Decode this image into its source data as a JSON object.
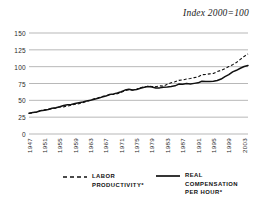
{
  "chart_data": {
    "type": "line",
    "title": "Index 2000=100",
    "xlabel": "",
    "ylabel": "",
    "ylim": [
      0,
      150
    ],
    "xlim": [
      1947,
      2004
    ],
    "grid": true,
    "legend_position": "bottom",
    "yticks": [
      150,
      125,
      100,
      75,
      50,
      25,
      0
    ],
    "xticks": [
      1947,
      1951,
      1955,
      1959,
      1963,
      1967,
      1971,
      1975,
      1979,
      1983,
      1987,
      1991,
      1995,
      1999,
      2003
    ],
    "x": [
      1947,
      1948,
      1949,
      1950,
      1951,
      1952,
      1953,
      1954,
      1955,
      1956,
      1957,
      1958,
      1959,
      1960,
      1961,
      1962,
      1963,
      1964,
      1965,
      1966,
      1967,
      1968,
      1969,
      1970,
      1971,
      1972,
      1973,
      1974,
      1975,
      1976,
      1977,
      1978,
      1979,
      1980,
      1981,
      1982,
      1983,
      1984,
      1985,
      1986,
      1987,
      1988,
      1989,
      1990,
      1991,
      1992,
      1993,
      1994,
      1995,
      1996,
      1997,
      1998,
      1999,
      2000,
      2001,
      2002,
      2003,
      2004
    ],
    "series": [
      {
        "name": "LABOR PRODUCTIVITY*",
        "style": "dashed",
        "color": "#111111",
        "values": [
          30.5,
          31.6,
          32.5,
          35.0,
          35.8,
          36.5,
          37.8,
          38.5,
          40.2,
          40.3,
          41.5,
          42.7,
          44.3,
          44.9,
          46.4,
          48.4,
          50.3,
          52.2,
          53.8,
          55.8,
          56.6,
          58.4,
          58.8,
          59.7,
          62.1,
          64.1,
          66.0,
          64.9,
          66.6,
          68.7,
          70.1,
          70.9,
          70.6,
          70.2,
          71.5,
          71.0,
          73.8,
          76.1,
          77.5,
          79.7,
          80.3,
          81.7,
          82.5,
          83.7,
          84.8,
          88.1,
          88.4,
          89.3,
          90.0,
          92.7,
          94.6,
          97.2,
          100.1,
          103.0,
          106.2,
          110.8,
          115.2,
          119.0
        ]
      },
      {
        "name": "REAL COMPENSATION PER HOUR*",
        "style": "solid",
        "color": "#111111",
        "values": [
          30.8,
          31.8,
          32.6,
          34.6,
          35.2,
          36.3,
          38.3,
          39.1,
          40.5,
          42.3,
          43.3,
          43.8,
          45.3,
          46.3,
          47.4,
          49.0,
          50.1,
          51.7,
          53.0,
          54.8,
          56.3,
          58.6,
          59.6,
          61.0,
          62.7,
          65.2,
          66.5,
          65.5,
          66.0,
          68.0,
          69.3,
          70.4,
          69.8,
          68.3,
          68.5,
          69.3,
          69.7,
          70.4,
          71.5,
          74.1,
          74.0,
          74.9,
          74.4,
          75.2,
          76.0,
          78.3,
          78.0,
          77.9,
          78.2,
          79.4,
          81.6,
          85.2,
          88.1,
          92.3,
          94.6,
          97.6,
          100.2,
          101.8
        ]
      }
    ]
  },
  "legend": [
    {
      "label": "LABOR\nPRODUCTIVITY*",
      "style": "dashed"
    },
    {
      "label": "REAL\nCOMPENSATION\nPER HOUR*",
      "style": "solid"
    }
  ]
}
